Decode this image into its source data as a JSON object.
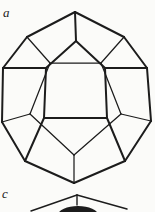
{
  "page": {
    "background_color": "#fbfbf9",
    "ink_color": "#1c1c1c",
    "width": 155,
    "height": 212
  },
  "figure_a": {
    "label": "a",
    "kind": "dodecahedron-wireframe",
    "stroke_front": 2.0,
    "stroke_back": 1.25,
    "vertices": {
      "D1": [
        75,
        12
      ],
      "D2": [
        124,
        37
      ],
      "D3": [
        147,
        68
      ],
      "D4": [
        151,
        121
      ],
      "D5": [
        125,
        161
      ],
      "D6": [
        74,
        183
      ],
      "D7": [
        25,
        161
      ],
      "D8": [
        2,
        122
      ],
      "D9": [
        3,
        68
      ],
      "D10": [
        27,
        37
      ],
      "F1": [
        76,
        41
      ],
      "F2": [
        105,
        68
      ],
      "F3": [
        107,
        118
      ],
      "F4": [
        44,
        118
      ],
      "F5": [
        46,
        68
      ],
      "Bul": [
        50,
        63
      ],
      "Bur": [
        101,
        63
      ],
      "Br": [
        121,
        114
      ],
      "Bb": [
        74,
        155
      ],
      "Bl": [
        30,
        114
      ]
    },
    "edges_front": [
      [
        "D1",
        "D2"
      ],
      [
        "D2",
        "D3"
      ],
      [
        "D3",
        "D4"
      ],
      [
        "D4",
        "D5"
      ],
      [
        "D5",
        "D6"
      ],
      [
        "D6",
        "D7"
      ],
      [
        "D7",
        "D8"
      ],
      [
        "D8",
        "D9"
      ],
      [
        "D9",
        "D10"
      ],
      [
        "D10",
        "D1"
      ],
      [
        "F1",
        "F2"
      ],
      [
        "F2",
        "F3"
      ],
      [
        "F3",
        "F4"
      ],
      [
        "F4",
        "F5"
      ],
      [
        "F5",
        "F1"
      ],
      [
        "F1",
        "D1"
      ],
      [
        "F2",
        "D3"
      ],
      [
        "F3",
        "D5"
      ],
      [
        "F4",
        "D7"
      ],
      [
        "F5",
        "D9"
      ]
    ],
    "edges_back": [
      [
        "Bul",
        "Bur"
      ],
      [
        "Bur",
        "Br"
      ],
      [
        "Br",
        "Bb"
      ],
      [
        "Bb",
        "Bl"
      ],
      [
        "Bl",
        "Bul"
      ],
      [
        "Bul",
        "D10"
      ],
      [
        "Bur",
        "D2"
      ],
      [
        "Br",
        "D4"
      ],
      [
        "Bb",
        "D6"
      ],
      [
        "Bl",
        "D8"
      ]
    ]
  },
  "figure_c": {
    "label": "c",
    "kind": "partial-polyhedron-top",
    "stroke": 1.4,
    "apex": [
      77,
      195
    ],
    "left_edge_end": [
      31,
      211
    ],
    "right_edge_end": [
      127,
      209
    ],
    "apex_tick_end": [
      77,
      205
    ],
    "dark_blob": {
      "cx": 78,
      "cy": 215,
      "rx": 20,
      "ry": 9
    }
  }
}
